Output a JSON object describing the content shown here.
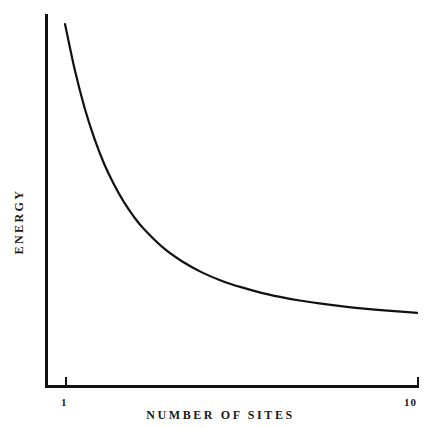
{
  "figure": {
    "background_color": "#ffffff",
    "ink_color": "#111111"
  },
  "axes": {
    "x_title": "NUMBER OF SITES",
    "y_title": "ENERGY",
    "x_tick_labels": [
      "1",
      "10"
    ],
    "y_tick_labels": []
  },
  "chart_data": {
    "type": "line",
    "title": "",
    "subtitle": "",
    "xlabel": "NUMBER OF SITES",
    "ylabel": "ENERGY",
    "xlim": [
      1,
      10
    ],
    "ylim": [
      0,
      1
    ],
    "grid": false,
    "legend": null,
    "legend_position": "none",
    "xticks": [
      1,
      10
    ],
    "xticklabels": [
      "1",
      "10"
    ],
    "yticks": [],
    "yticklabels": [],
    "annotations": [],
    "series": [
      {
        "name": "energy-vs-sites",
        "color": "#111111",
        "line_width": 2.2,
        "x": [
          1.0,
          1.25,
          1.5,
          1.75,
          2.0,
          2.25,
          2.5,
          2.75,
          3.0,
          3.5,
          4.0,
          4.5,
          5.0,
          5.5,
          6.0,
          6.5,
          7.0,
          7.5,
          8.0,
          8.5,
          9.0,
          9.5,
          10.0
        ],
        "y": [
          1.0,
          0.873,
          0.768,
          0.683,
          0.613,
          0.556,
          0.508,
          0.468,
          0.434,
          0.381,
          0.342,
          0.312,
          0.289,
          0.271,
          0.256,
          0.244,
          0.234,
          0.226,
          0.219,
          0.213,
          0.208,
          0.204,
          0.2
        ]
      }
    ]
  }
}
